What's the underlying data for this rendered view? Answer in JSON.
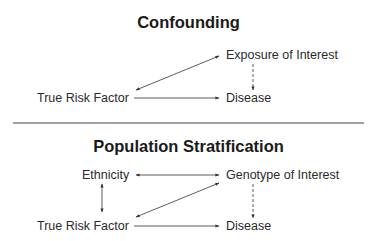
{
  "panels": [
    {
      "title": "Confounding",
      "nodes": {
        "exposure": "Exposure of Interest",
        "risk_factor": "True Risk Factor",
        "disease": "Disease"
      },
      "edges": [
        {
          "from": "risk_factor",
          "to": "exposure",
          "style": "solid",
          "direction": "both"
        },
        {
          "from": "risk_factor",
          "to": "disease",
          "style": "solid",
          "direction": "forward"
        },
        {
          "from": "exposure",
          "to": "disease",
          "style": "dashed",
          "direction": "forward"
        }
      ]
    },
    {
      "title": "Population Stratification",
      "nodes": {
        "ethnicity": "Ethnicity",
        "genotype": "Genotype of Interest",
        "risk_factor": "True Risk Factor",
        "disease": "Disease"
      },
      "edges": [
        {
          "from": "ethnicity",
          "to": "genotype",
          "style": "solid",
          "direction": "both"
        },
        {
          "from": "ethnicity",
          "to": "risk_factor",
          "style": "solid",
          "direction": "both"
        },
        {
          "from": "risk_factor",
          "to": "genotype",
          "style": "solid",
          "direction": "both"
        },
        {
          "from": "risk_factor",
          "to": "disease",
          "style": "solid",
          "direction": "forward"
        },
        {
          "from": "genotype",
          "to": "disease",
          "style": "dashed",
          "direction": "forward"
        }
      ]
    }
  ],
  "colors": {
    "line": "#333333",
    "text": "#222222",
    "divider": "#444444"
  }
}
